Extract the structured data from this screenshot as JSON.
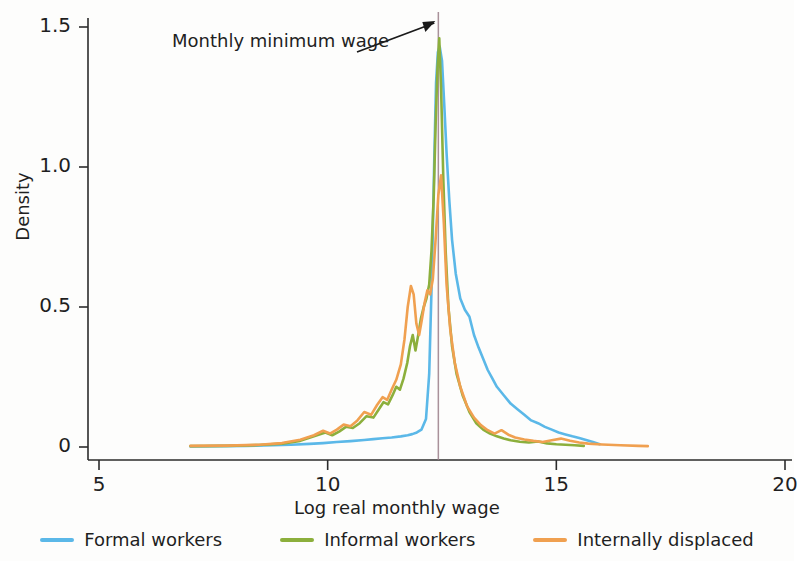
{
  "chart_data": {
    "type": "line",
    "title": "",
    "xlabel": "Log real monthly wage",
    "ylabel": "Density",
    "xlim": [
      5,
      20
    ],
    "ylim": [
      0,
      1.55
    ],
    "xticks": [
      5,
      10,
      15,
      20
    ],
    "xtick_labels": [
      "5",
      "10",
      "15",
      "20"
    ],
    "yticks": [
      0,
      0.5,
      1.0,
      1.5
    ],
    "ytick_labels": [
      "0",
      "0.5",
      "1.0",
      "1.5"
    ],
    "grid": false,
    "legend_position": "bottom",
    "annotations": [
      {
        "text": "Monthly minimum wage",
        "target_x": 12.42,
        "kind": "vertical-line-with-arrow",
        "line_color": "#9b7f8a"
      }
    ],
    "series": [
      {
        "name": "Formal workers",
        "color": "#5bb8e8",
        "x": [
          7.0,
          7.6,
          8.2,
          8.8,
          9.2,
          9.6,
          9.9,
          10.2,
          10.5,
          10.8,
          11.0,
          11.2,
          11.4,
          11.6,
          11.75,
          11.85,
          11.95,
          12.05,
          12.15,
          12.22,
          12.28,
          12.33,
          12.37,
          12.41,
          12.45,
          12.5,
          12.55,
          12.6,
          12.66,
          12.72,
          12.8,
          12.9,
          13.0,
          13.1,
          13.2,
          13.3,
          13.4,
          13.5,
          13.6,
          13.7,
          13.85,
          14.0,
          14.15,
          14.3,
          14.45,
          14.6,
          14.75,
          14.9,
          15.05,
          15.2,
          15.35,
          15.5,
          15.65,
          15.8,
          15.95
        ],
        "y": [
          0.002,
          0.003,
          0.004,
          0.006,
          0.008,
          0.011,
          0.014,
          0.018,
          0.021,
          0.025,
          0.028,
          0.031,
          0.034,
          0.038,
          0.042,
          0.046,
          0.052,
          0.062,
          0.1,
          0.26,
          0.62,
          1.02,
          1.3,
          1.41,
          1.43,
          1.38,
          1.22,
          1.05,
          0.88,
          0.74,
          0.62,
          0.53,
          0.49,
          0.465,
          0.4,
          0.355,
          0.315,
          0.275,
          0.245,
          0.215,
          0.185,
          0.155,
          0.135,
          0.115,
          0.095,
          0.085,
          0.072,
          0.062,
          0.052,
          0.045,
          0.038,
          0.032,
          0.025,
          0.018,
          0.01
        ]
      },
      {
        "name": "Informal workers",
        "color": "#8caf3c",
        "x": [
          7.0,
          7.8,
          8.5,
          9.0,
          9.4,
          9.7,
          9.95,
          10.1,
          10.25,
          10.4,
          10.55,
          10.7,
          10.85,
          11.0,
          11.12,
          11.22,
          11.32,
          11.42,
          11.5,
          11.58,
          11.66,
          11.74,
          11.8,
          11.86,
          11.92,
          11.98,
          12.04,
          12.1,
          12.16,
          12.22,
          12.27,
          12.32,
          12.36,
          12.4,
          12.44,
          12.48,
          12.53,
          12.58,
          12.64,
          12.72,
          12.82,
          12.95,
          13.1,
          13.25,
          13.4,
          13.55,
          13.7,
          13.85,
          14.0,
          14.2,
          14.4,
          14.6,
          14.8,
          15.0,
          15.2,
          15.4,
          15.6
        ],
        "y": [
          0.003,
          0.004,
          0.007,
          0.012,
          0.022,
          0.038,
          0.052,
          0.042,
          0.055,
          0.072,
          0.068,
          0.085,
          0.11,
          0.105,
          0.135,
          0.16,
          0.152,
          0.185,
          0.215,
          0.205,
          0.245,
          0.3,
          0.36,
          0.4,
          0.345,
          0.4,
          0.46,
          0.5,
          0.53,
          0.58,
          0.7,
          0.9,
          1.15,
          1.35,
          1.46,
          1.28,
          0.95,
          0.7,
          0.5,
          0.36,
          0.26,
          0.185,
          0.125,
          0.085,
          0.062,
          0.048,
          0.038,
          0.03,
          0.024,
          0.019,
          0.016,
          0.02,
          0.013,
          0.01,
          0.008,
          0.006,
          0.004
        ]
      },
      {
        "name": "Internally displaced",
        "color": "#f0a050",
        "x": [
          7.0,
          7.8,
          8.5,
          9.0,
          9.4,
          9.7,
          9.9,
          10.05,
          10.2,
          10.35,
          10.5,
          10.65,
          10.8,
          10.95,
          11.08,
          11.2,
          11.3,
          11.4,
          11.5,
          11.6,
          11.68,
          11.75,
          11.82,
          11.88,
          11.94,
          12.0,
          12.06,
          12.12,
          12.18,
          12.24,
          12.3,
          12.36,
          12.42,
          12.48,
          12.54,
          12.6,
          12.68,
          12.78,
          12.9,
          13.05,
          13.2,
          13.35,
          13.5,
          13.65,
          13.8,
          13.95,
          14.1,
          14.3,
          14.5,
          14.7,
          14.9,
          15.1,
          15.3,
          15.5,
          15.7,
          16.0,
          16.4,
          16.8,
          17.0
        ],
        "y": [
          0.004,
          0.005,
          0.008,
          0.014,
          0.026,
          0.042,
          0.058,
          0.048,
          0.062,
          0.08,
          0.074,
          0.095,
          0.125,
          0.115,
          0.15,
          0.178,
          0.168,
          0.205,
          0.24,
          0.295,
          0.385,
          0.5,
          0.575,
          0.545,
          0.44,
          0.4,
          0.455,
          0.515,
          0.56,
          0.545,
          0.6,
          0.74,
          0.9,
          0.97,
          0.8,
          0.58,
          0.42,
          0.3,
          0.215,
          0.145,
          0.105,
          0.078,
          0.06,
          0.048,
          0.06,
          0.044,
          0.034,
          0.027,
          0.022,
          0.018,
          0.024,
          0.03,
          0.022,
          0.016,
          0.012,
          0.009,
          0.006,
          0.004,
          0.003
        ]
      }
    ]
  },
  "axis": {
    "y_title": "Density",
    "x_title": "Log real monthly wage"
  },
  "annotation": {
    "text": "Monthly minimum wage"
  },
  "legend": {
    "items": [
      {
        "label": "Formal workers",
        "color": "#5bb8e8"
      },
      {
        "label": "Informal workers",
        "color": "#8caf3c"
      },
      {
        "label": "Internally displaced",
        "color": "#f0a050"
      }
    ]
  }
}
